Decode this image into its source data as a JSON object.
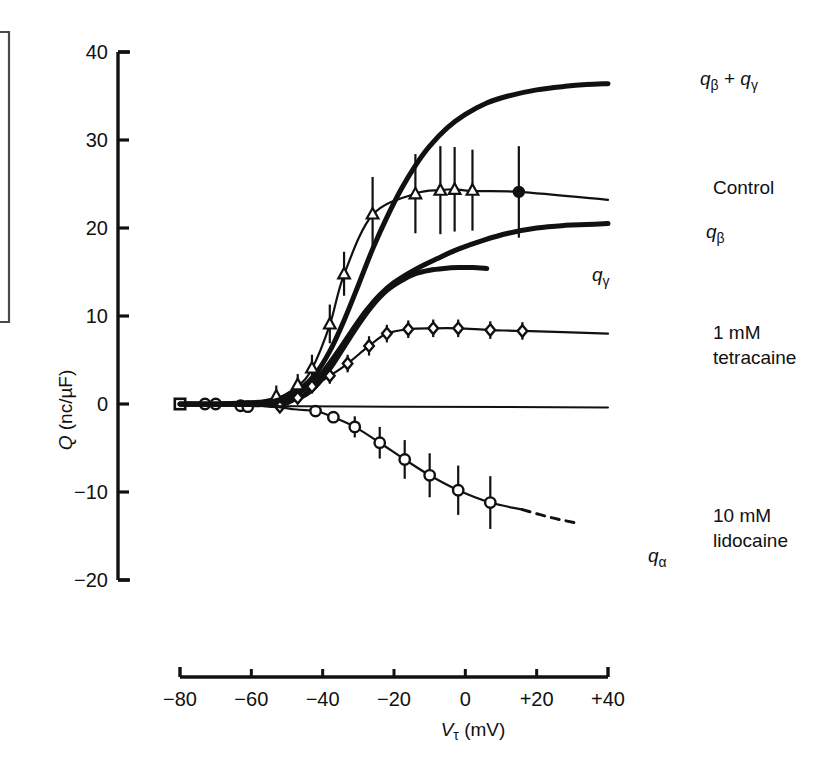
{
  "figure": {
    "background": "#ffffff",
    "ink_color": "#111111"
  },
  "chart_data": {
    "type": "line",
    "title": "",
    "subtitle": "",
    "xlabel": "VT (mV)",
    "ylabel": "Q (nc/µF)",
    "xlim": [
      -80,
      40
    ],
    "ylim": [
      -20,
      40
    ],
    "xticks": [
      -80,
      -60,
      -40,
      -20,
      0,
      20,
      40
    ],
    "xticklabels": [
      "−80",
      "−60",
      "−40",
      "−20",
      "0",
      "+20",
      "+40"
    ],
    "yticks": [
      -20,
      -10,
      0,
      10,
      20,
      30,
      40
    ],
    "yticklabels": [
      "−20",
      "−10",
      "0",
      "10",
      "20",
      "30",
      "40"
    ],
    "grid": false,
    "legend_position": "right-inline-labels",
    "series": [
      {
        "name": "q_beta + q_gamma",
        "label": "qβ + qγ",
        "style": "thick-solid",
        "marker": "none",
        "label_x": 44,
        "label_y": 36.4,
        "x": [
          -80,
          -70,
          -62,
          -56,
          -50,
          -46,
          -42,
          -38,
          -34,
          -30,
          -26,
          -22,
          -18,
          -14,
          -10,
          -5,
          0,
          6,
          12,
          20,
          28,
          34,
          40
        ],
        "y": [
          0,
          0,
          0.1,
          0.3,
          0.9,
          1.8,
          3.4,
          6.0,
          9.5,
          13.5,
          17.6,
          21.2,
          24.4,
          27.1,
          29.3,
          31.4,
          32.9,
          34.2,
          35.0,
          35.7,
          36.1,
          36.3,
          36.4
        ]
      },
      {
        "name": "control",
        "label": "Control",
        "style": "thin-solid-with-markers",
        "marker": "triangle-up",
        "label_x": 44,
        "label_y": 23.8,
        "x": [
          -80,
          -73,
          -70,
          -65,
          -62,
          -56,
          -53,
          -47,
          -43,
          -38,
          -34,
          -26,
          -14,
          -7,
          -3,
          2,
          15,
          40
        ],
        "y": [
          0,
          0,
          0,
          -0.1,
          -0.2,
          -0.2,
          0.5,
          2.0,
          4.0,
          9.0,
          14.7,
          21.5,
          23.9,
          24.3,
          24.4,
          24.2,
          24.1,
          23.2
        ],
        "points": [
          {
            "x": -80,
            "y": 0,
            "err": 0,
            "marker": "square"
          },
          {
            "x": -73,
            "y": 0,
            "err": 0,
            "marker": "circle"
          },
          {
            "x": -70,
            "y": 0,
            "err": 0,
            "marker": "circle"
          },
          {
            "x": -63,
            "y": -0.2,
            "err": 0.6,
            "marker": "circle"
          },
          {
            "x": -61,
            "y": -0.3,
            "err": 0.6,
            "marker": "circle"
          },
          {
            "x": -53,
            "y": 0.9,
            "err": 1.2,
            "marker": "triangle-up"
          },
          {
            "x": -47,
            "y": 2.2,
            "err": 1.2,
            "marker": "triangle-up"
          },
          {
            "x": -43,
            "y": 4.1,
            "err": 1.5,
            "marker": "triangle-up"
          },
          {
            "x": -38,
            "y": 9.1,
            "err": 2.2,
            "marker": "triangle-up"
          },
          {
            "x": -34,
            "y": 14.8,
            "err": 2.5,
            "marker": "triangle-up"
          },
          {
            "x": -26,
            "y": 21.6,
            "err": 4.2,
            "marker": "triangle-up"
          },
          {
            "x": -14,
            "y": 23.9,
            "err": 4.5,
            "marker": "triangle-up"
          },
          {
            "x": -7,
            "y": 24.3,
            "err": 5.0,
            "marker": "triangle-up"
          },
          {
            "x": -3,
            "y": 24.4,
            "err": 4.8,
            "marker": "triangle-up"
          },
          {
            "x": 2,
            "y": 24.3,
            "err": 4.6,
            "marker": "triangle-up"
          },
          {
            "x": 15,
            "y": 24.1,
            "err": 5.2,
            "marker": "circle-filled"
          }
        ]
      },
      {
        "name": "q_beta",
        "label": "qβ",
        "style": "thick-solid",
        "marker": "none",
        "label_x": 44,
        "label_y": 20.5,
        "x": [
          -80,
          -68,
          -60,
          -54,
          -48,
          -44,
          -40,
          -36,
          -32,
          -28,
          -24,
          -20,
          -14,
          -8,
          -2,
          5,
          12,
          20,
          28,
          34,
          40
        ],
        "y": [
          0,
          0,
          0.1,
          0.3,
          1.0,
          2.0,
          3.6,
          5.8,
          8.2,
          10.5,
          12.4,
          13.8,
          15.3,
          16.5,
          17.6,
          18.6,
          19.4,
          20.0,
          20.3,
          20.4,
          20.5
        ]
      },
      {
        "name": "q_gamma",
        "label": "qγ",
        "style": "thick-solid",
        "marker": "none",
        "label_x": 12,
        "label_y": 16.1,
        "x": [
          -80,
          -60,
          -52,
          -46,
          -42,
          -38,
          -34,
          -30,
          -26,
          -22,
          -18,
          -14,
          -10,
          -6,
          -2,
          2,
          6
        ],
        "y": [
          0,
          0,
          0.2,
          0.8,
          2.0,
          4.0,
          6.5,
          9.0,
          11.2,
          12.9,
          14.0,
          14.8,
          15.2,
          15.4,
          15.5,
          15.5,
          15.4
        ]
      },
      {
        "name": "tetracaine_1mm",
        "label": "1 mM tetracaine",
        "label_line1": "1 mM",
        "label_line2": "tetracaine",
        "style": "thin-solid-with-markers",
        "marker": "diamond",
        "label_x": 44,
        "label_y": 9.3,
        "x": [
          -80,
          -66,
          -58,
          -52,
          -47,
          -43,
          -38,
          -33,
          -27,
          -22,
          -16,
          -9,
          -2,
          7,
          16,
          40
        ],
        "y": [
          0,
          0,
          -0.2,
          -0.3,
          0.6,
          1.9,
          3.2,
          4.6,
          6.6,
          8.0,
          8.5,
          8.6,
          8.6,
          8.4,
          8.3,
          8.0
        ],
        "points": [
          {
            "x": -52,
            "y": -0.3,
            "err": 0.5,
            "marker": "diamond"
          },
          {
            "x": -47,
            "y": 0.7,
            "err": 0.6,
            "marker": "diamond"
          },
          {
            "x": -43,
            "y": 2.0,
            "err": 0.8,
            "marker": "diamond"
          },
          {
            "x": -38,
            "y": 3.2,
            "err": 0.9,
            "marker": "diamond"
          },
          {
            "x": -33,
            "y": 4.6,
            "err": 1.0,
            "marker": "diamond"
          },
          {
            "x": -27,
            "y": 6.6,
            "err": 1.1,
            "marker": "diamond"
          },
          {
            "x": -22,
            "y": 8.0,
            "err": 1.0,
            "marker": "diamond"
          },
          {
            "x": -16,
            "y": 8.5,
            "err": 1.0,
            "marker": "diamond"
          },
          {
            "x": -9,
            "y": 8.6,
            "err": 1.0,
            "marker": "diamond"
          },
          {
            "x": -2,
            "y": 8.6,
            "err": 1.0,
            "marker": "diamond"
          },
          {
            "x": 7,
            "y": 8.4,
            "err": 1.0,
            "marker": "diamond"
          },
          {
            "x": 16,
            "y": 8.3,
            "err": 1.0,
            "marker": "diamond"
          }
        ]
      },
      {
        "name": "lidocaine_10mm",
        "label": "10 mM lidocaine",
        "label_line1": "10 mM",
        "label_line2": "lidocaine",
        "style": "thin-solid-then-dashed-with-markers",
        "marker": "circle",
        "label_x": 44,
        "label_y": -11.0,
        "sub_label": "qα",
        "sub_label_x": 28,
        "sub_label_y": -14.6,
        "x": [
          -80,
          -60,
          -48,
          -42,
          -37,
          -31,
          -24,
          -17,
          -10,
          -2,
          7,
          16,
          24,
          32
        ],
        "y": [
          0,
          0,
          -0.6,
          -0.8,
          -1.5,
          -2.6,
          -4.4,
          -6.3,
          -8.1,
          -9.8,
          -11.2,
          -12.0,
          -12.9,
          -13.6
        ],
        "dash_from_x": 16,
        "points": [
          {
            "x": -42,
            "y": -0.8,
            "err": 0.4,
            "marker": "circle"
          },
          {
            "x": -37,
            "y": -1.5,
            "err": 0.5,
            "marker": "circle"
          },
          {
            "x": -31,
            "y": -2.6,
            "err": 1.2,
            "marker": "circle"
          },
          {
            "x": -24,
            "y": -4.4,
            "err": 1.8,
            "marker": "circle"
          },
          {
            "x": -17,
            "y": -6.3,
            "err": 2.2,
            "marker": "circle"
          },
          {
            "x": -10,
            "y": -8.1,
            "err": 2.5,
            "marker": "circle"
          },
          {
            "x": -2,
            "y": -9.8,
            "err": 2.8,
            "marker": "circle"
          },
          {
            "x": 7,
            "y": -11.2,
            "err": 3.0,
            "marker": "circle"
          }
        ]
      },
      {
        "name": "zero_baseline",
        "label": "",
        "style": "thin-solid",
        "marker": "none",
        "x": [
          -80,
          40
        ],
        "y": [
          -0.2,
          -0.4
        ]
      }
    ]
  },
  "annotations": {
    "q_beta_plus_q_gamma": "qβ + qγ",
    "control": "Control",
    "q_beta": "qβ",
    "q_gamma": "qγ",
    "tetracaine_line1": "1 mM",
    "tetracaine_line2": "tetracaine",
    "lidocaine_line1": "10 mM",
    "lidocaine_line2": "lidocaine",
    "q_alpha": "qα"
  },
  "axis_text": {
    "y_axis_q": "Q",
    "y_axis_units": "(nc/µF)",
    "x_axis_v": "V",
    "x_axis_tau": "τ",
    "x_axis_units": "(mV)"
  }
}
